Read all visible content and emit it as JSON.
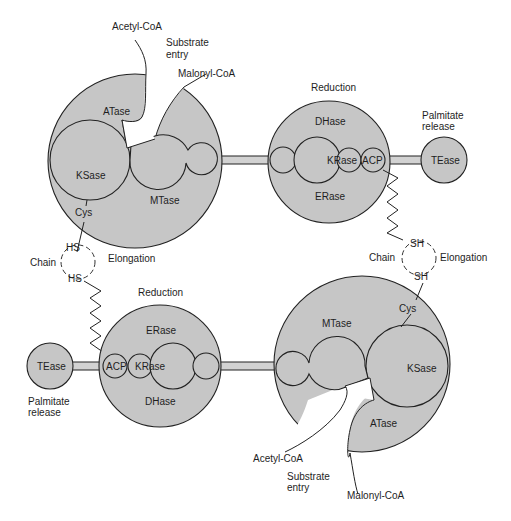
{
  "diagram": {
    "title_fragment": "",
    "colors": {
      "enzyme_fill": "#c6c6c6",
      "outline": "#222222",
      "background": "#ffffff"
    },
    "top_left_unit": {
      "domains": {
        "atase": "ATase",
        "ksase": "KSase",
        "mtase": "MTase",
        "cys": "Cys"
      },
      "substrates": {
        "acetyl": "Acetyl-CoA",
        "malonyl": "Malonyl-CoA",
        "entry_line1": "Substrate",
        "entry_line2": "entry"
      },
      "chain": {
        "hs_top": "HS",
        "hs_bottom": "HS",
        "chain": "Chain",
        "elongation": "Elongation"
      }
    },
    "top_right_unit": {
      "label": "Reduction",
      "domains": {
        "dhase": "DHase",
        "krase": "KRase",
        "acp": "ACP",
        "erase": "ERase",
        "tease": "TEase"
      },
      "release_line1": "Palmitate",
      "release_line2": "release",
      "chain": {
        "sh_top": "SH",
        "sh_bottom": "SH",
        "chain": "Chain",
        "elongation": "Elongation"
      }
    },
    "bottom_left_unit": {
      "label": "Reduction",
      "domains": {
        "erase": "ERase",
        "krase": "KRase",
        "acp": "ACP",
        "dhase": "DHase",
        "tease": "TEase"
      },
      "release_line1": "Palmitate",
      "release_line2": "release"
    },
    "bottom_right_unit": {
      "domains": {
        "mtase": "MTase",
        "ksase": "KSase",
        "atase": "ATase",
        "cys": "Cys"
      },
      "substrates": {
        "acetyl": "Acetyl-CoA",
        "malonyl": "Malonyl-CoA",
        "entry_line1": "Substrate",
        "entry_line2": "entry"
      }
    }
  }
}
